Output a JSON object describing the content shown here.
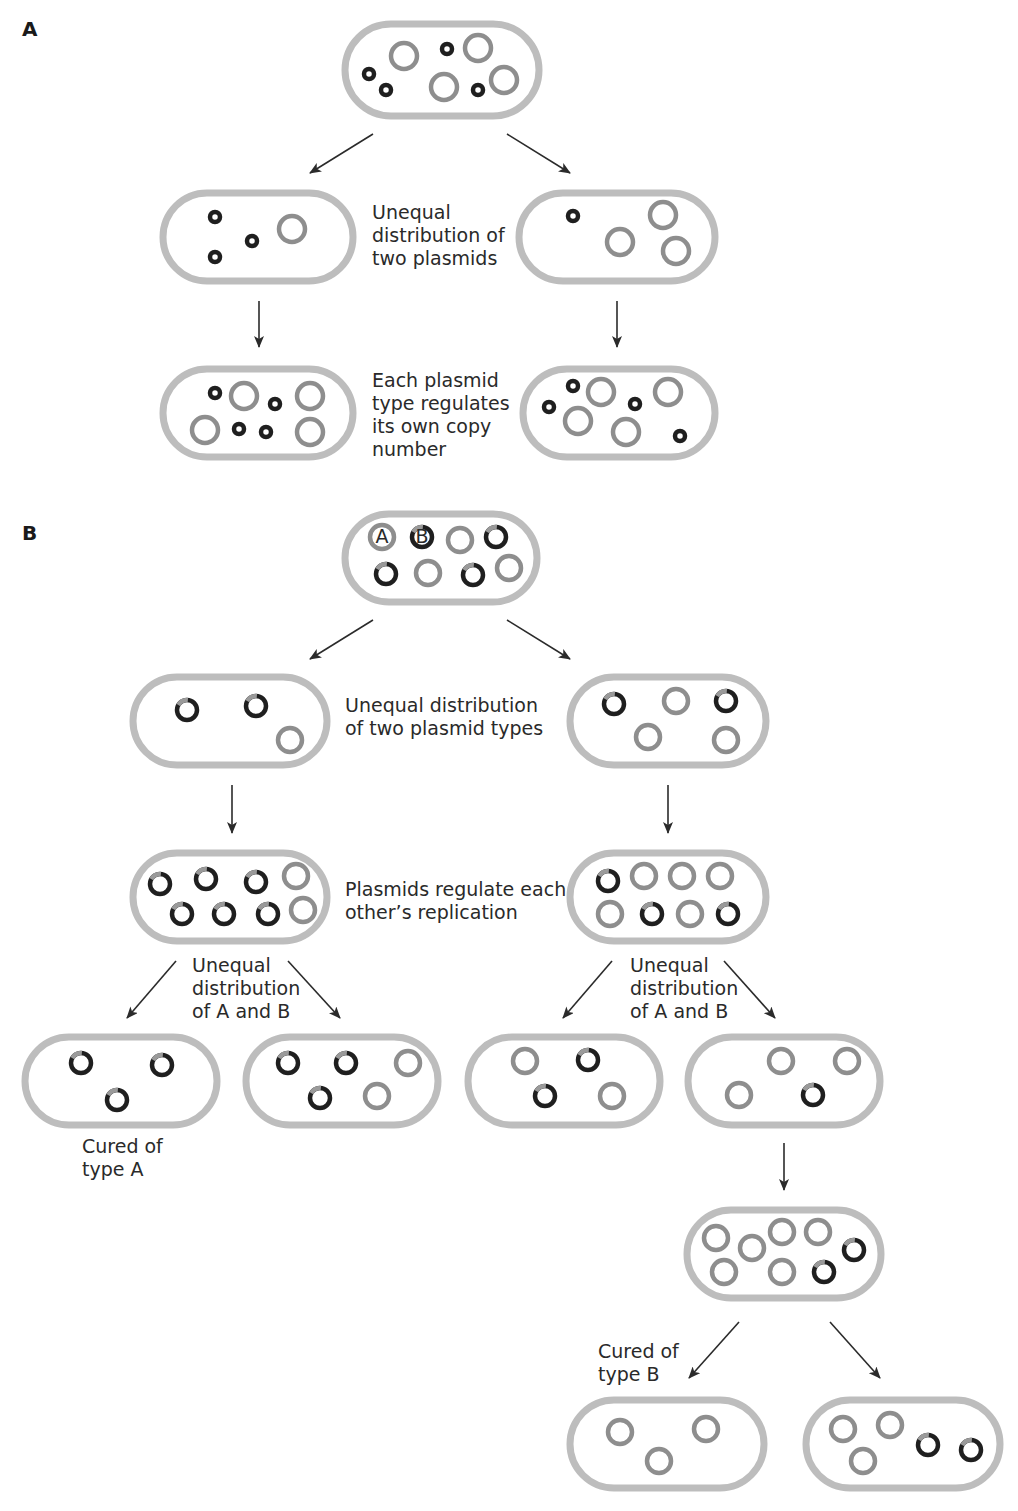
{
  "colors": {
    "cell_wall": "#bdbdbd",
    "plasmid_gray": "#8e8e8e",
    "plasmid_dark": "#1f1f1f",
    "plasmid_dark_tip": "#9a9a9a",
    "text": "#2a2a2a",
    "arrow": "#2b2b2b"
  },
  "panels": [
    {
      "letter": "A",
      "x": 22,
      "y": 22
    },
    {
      "letter": "B",
      "x": 22,
      "y": 526
    }
  ],
  "labels": [
    {
      "id": "a-unequal",
      "x": 372,
      "y": 219,
      "lines": [
        "Unequal",
        "distribution of",
        "two plasmids"
      ]
    },
    {
      "id": "a-regulates",
      "x": 372,
      "y": 387,
      "lines": [
        "Each plasmid",
        "type regulates",
        "its own copy",
        "number"
      ]
    },
    {
      "id": "b-unequal",
      "x": 345,
      "y": 712,
      "lines": [
        "Unequal distribution",
        "of two plasmid types"
      ]
    },
    {
      "id": "b-regulate-each",
      "x": 345,
      "y": 896,
      "lines": [
        "Plasmids regulate each",
        "other’s replication"
      ]
    },
    {
      "id": "b-unequal-ab-left",
      "x": 192,
      "y": 972,
      "lines": [
        "Unequal",
        "distribution",
        "of A and B"
      ]
    },
    {
      "id": "b-unequal-ab-right",
      "x": 630,
      "y": 972,
      "lines": [
        "Unequal",
        "distribution",
        "of A and B"
      ]
    },
    {
      "id": "b-cured-a",
      "x": 82,
      "y": 1153,
      "lines": [
        "Cured of",
        "type A"
      ]
    },
    {
      "id": "b-cured-b",
      "x": 598,
      "y": 1358,
      "lines": [
        "Cured of",
        "type B"
      ]
    }
  ],
  "cells": [
    {
      "id": "a-parent",
      "x": 345,
      "y": 24,
      "w": 194,
      "h": 92,
      "plasmids": [
        {
          "t": "small",
          "x": 369,
          "y": 74
        },
        {
          "t": "small",
          "x": 386,
          "y": 90
        },
        {
          "t": "big",
          "x": 404,
          "y": 56
        },
        {
          "t": "small",
          "x": 447,
          "y": 49
        },
        {
          "t": "big",
          "x": 478,
          "y": 48
        },
        {
          "t": "big",
          "x": 444,
          "y": 87
        },
        {
          "t": "small",
          "x": 478,
          "y": 90
        },
        {
          "t": "big",
          "x": 504,
          "y": 80
        }
      ]
    },
    {
      "id": "a-left-1",
      "x": 163,
      "y": 193,
      "w": 190,
      "h": 88,
      "plasmids": [
        {
          "t": "small",
          "x": 215,
          "y": 217
        },
        {
          "t": "small",
          "x": 215,
          "y": 257
        },
        {
          "t": "small",
          "x": 252,
          "y": 241
        },
        {
          "t": "big",
          "x": 292,
          "y": 229
        }
      ]
    },
    {
      "id": "a-right-1",
      "x": 519,
      "y": 193,
      "w": 196,
      "h": 88,
      "plasmids": [
        {
          "t": "small",
          "x": 573,
          "y": 216
        },
        {
          "t": "big",
          "x": 663,
          "y": 215
        },
        {
          "t": "big",
          "x": 620,
          "y": 242
        },
        {
          "t": "big",
          "x": 676,
          "y": 251
        }
      ]
    },
    {
      "id": "a-left-2",
      "x": 163,
      "y": 369,
      "w": 190,
      "h": 88,
      "plasmids": [
        {
          "t": "small",
          "x": 215,
          "y": 393
        },
        {
          "t": "big",
          "x": 244,
          "y": 396
        },
        {
          "t": "small",
          "x": 275,
          "y": 404
        },
        {
          "t": "big",
          "x": 310,
          "y": 396
        },
        {
          "t": "big",
          "x": 205,
          "y": 430
        },
        {
          "t": "small",
          "x": 239,
          "y": 429
        },
        {
          "t": "small",
          "x": 266,
          "y": 432
        },
        {
          "t": "big",
          "x": 310,
          "y": 432
        }
      ]
    },
    {
      "id": "a-right-2",
      "x": 523,
      "y": 369,
      "w": 192,
      "h": 88,
      "plasmids": [
        {
          "t": "small",
          "x": 573,
          "y": 386
        },
        {
          "t": "small",
          "x": 549,
          "y": 407
        },
        {
          "t": "big",
          "x": 601,
          "y": 392
        },
        {
          "t": "small",
          "x": 635,
          "y": 404
        },
        {
          "t": "big",
          "x": 668,
          "y": 392
        },
        {
          "t": "big",
          "x": 578,
          "y": 421
        },
        {
          "t": "big",
          "x": 626,
          "y": 432
        },
        {
          "t": "small",
          "x": 680,
          "y": 436
        }
      ]
    },
    {
      "id": "b-parent",
      "x": 345,
      "y": 514,
      "w": 192,
      "h": 88,
      "plasmids": [
        {
          "t": "A",
          "x": 382,
          "y": 537,
          "label": "A"
        },
        {
          "t": "B",
          "x": 422,
          "y": 537,
          "label": "B"
        },
        {
          "t": "a",
          "x": 460,
          "y": 540
        },
        {
          "t": "b",
          "x": 496,
          "y": 537
        },
        {
          "t": "b",
          "x": 386,
          "y": 574
        },
        {
          "t": "a",
          "x": 428,
          "y": 573
        },
        {
          "t": "b",
          "x": 473,
          "y": 575
        },
        {
          "t": "a",
          "x": 509,
          "y": 568
        }
      ]
    },
    {
      "id": "b-left-1",
      "x": 133,
      "y": 677,
      "w": 194,
      "h": 88,
      "plasmids": [
        {
          "t": "b",
          "x": 187,
          "y": 710
        },
        {
          "t": "b",
          "x": 256,
          "y": 706
        },
        {
          "t": "a",
          "x": 290,
          "y": 740
        }
      ]
    },
    {
      "id": "b-right-1",
      "x": 570,
      "y": 677,
      "w": 196,
      "h": 88,
      "plasmids": [
        {
          "t": "b",
          "x": 614,
          "y": 704
        },
        {
          "t": "a",
          "x": 676,
          "y": 701
        },
        {
          "t": "b",
          "x": 726,
          "y": 701
        },
        {
          "t": "a",
          "x": 648,
          "y": 737
        },
        {
          "t": "a",
          "x": 726,
          "y": 740
        }
      ]
    },
    {
      "id": "b-left-2",
      "x": 133,
      "y": 853,
      "w": 194,
      "h": 88,
      "plasmids": [
        {
          "t": "b",
          "x": 160,
          "y": 884
        },
        {
          "t": "b",
          "x": 206,
          "y": 879
        },
        {
          "t": "b",
          "x": 256,
          "y": 882
        },
        {
          "t": "a",
          "x": 296,
          "y": 876
        },
        {
          "t": "b",
          "x": 182,
          "y": 914
        },
        {
          "t": "b",
          "x": 224,
          "y": 914
        },
        {
          "t": "b",
          "x": 268,
          "y": 914
        },
        {
          "t": "a",
          "x": 303,
          "y": 910
        }
      ]
    },
    {
      "id": "b-right-2",
      "x": 570,
      "y": 853,
      "w": 196,
      "h": 88,
      "plasmids": [
        {
          "t": "b",
          "x": 608,
          "y": 881
        },
        {
          "t": "a",
          "x": 644,
          "y": 876
        },
        {
          "t": "a",
          "x": 682,
          "y": 876
        },
        {
          "t": "a",
          "x": 720,
          "y": 876
        },
        {
          "t": "a",
          "x": 610,
          "y": 914
        },
        {
          "t": "b",
          "x": 652,
          "y": 914
        },
        {
          "t": "a",
          "x": 690,
          "y": 914
        },
        {
          "t": "b",
          "x": 728,
          "y": 914
        }
      ]
    },
    {
      "id": "b-left-3a",
      "x": 25,
      "y": 1037,
      "w": 192,
      "h": 88,
      "plasmids": [
        {
          "t": "b",
          "x": 81,
          "y": 1063
        },
        {
          "t": "b",
          "x": 162,
          "y": 1065
        },
        {
          "t": "b",
          "x": 117,
          "y": 1100
        }
      ]
    },
    {
      "id": "b-left-3b",
      "x": 246,
      "y": 1037,
      "w": 192,
      "h": 88,
      "plasmids": [
        {
          "t": "b",
          "x": 288,
          "y": 1063
        },
        {
          "t": "b",
          "x": 346,
          "y": 1063
        },
        {
          "t": "a",
          "x": 408,
          "y": 1063
        },
        {
          "t": "b",
          "x": 320,
          "y": 1098
        },
        {
          "t": "a",
          "x": 377,
          "y": 1096
        }
      ]
    },
    {
      "id": "b-right-3a",
      "x": 468,
      "y": 1037,
      "w": 192,
      "h": 88,
      "plasmids": [
        {
          "t": "a",
          "x": 525,
          "y": 1061
        },
        {
          "t": "b",
          "x": 588,
          "y": 1060
        },
        {
          "t": "b",
          "x": 545,
          "y": 1096
        },
        {
          "t": "a",
          "x": 612,
          "y": 1096
        }
      ]
    },
    {
      "id": "b-right-3b",
      "x": 688,
      "y": 1037,
      "w": 192,
      "h": 88,
      "plasmids": [
        {
          "t": "a",
          "x": 781,
          "y": 1061
        },
        {
          "t": "a",
          "x": 847,
          "y": 1061
        },
        {
          "t": "a",
          "x": 739,
          "y": 1095
        },
        {
          "t": "b",
          "x": 813,
          "y": 1095
        }
      ]
    },
    {
      "id": "b-right-4",
      "x": 687,
      "y": 1210,
      "w": 194,
      "h": 88,
      "plasmids": [
        {
          "t": "a",
          "x": 716,
          "y": 1238
        },
        {
          "t": "a",
          "x": 752,
          "y": 1248
        },
        {
          "t": "a",
          "x": 782,
          "y": 1232
        },
        {
          "t": "a",
          "x": 818,
          "y": 1232
        },
        {
          "t": "b",
          "x": 854,
          "y": 1250
        },
        {
          "t": "a",
          "x": 724,
          "y": 1272
        },
        {
          "t": "a",
          "x": 782,
          "y": 1272
        },
        {
          "t": "b",
          "x": 824,
          "y": 1272
        }
      ]
    },
    {
      "id": "b-right-5a",
      "x": 570,
      "y": 1400,
      "w": 194,
      "h": 88,
      "plasmids": [
        {
          "t": "a",
          "x": 620,
          "y": 1432
        },
        {
          "t": "a",
          "x": 706,
          "y": 1429
        },
        {
          "t": "a",
          "x": 659,
          "y": 1461
        }
      ]
    },
    {
      "id": "b-right-5b",
      "x": 806,
      "y": 1400,
      "w": 194,
      "h": 88,
      "plasmids": [
        {
          "t": "a",
          "x": 843,
          "y": 1429
        },
        {
          "t": "a",
          "x": 890,
          "y": 1425
        },
        {
          "t": "b",
          "x": 928,
          "y": 1445
        },
        {
          "t": "b",
          "x": 971,
          "y": 1450
        },
        {
          "t": "a",
          "x": 863,
          "y": 1461
        }
      ]
    }
  ],
  "arrows": [
    {
      "x1": 373,
      "y1": 134,
      "x2": 310,
      "y2": 173
    },
    {
      "x1": 507,
      "y1": 134,
      "x2": 570,
      "y2": 173
    },
    {
      "x1": 259,
      "y1": 301,
      "x2": 259,
      "y2": 347
    },
    {
      "x1": 617,
      "y1": 301,
      "x2": 617,
      "y2": 347
    },
    {
      "x1": 373,
      "y1": 620,
      "x2": 310,
      "y2": 659
    },
    {
      "x1": 507,
      "y1": 620,
      "x2": 570,
      "y2": 659
    },
    {
      "x1": 232,
      "y1": 785,
      "x2": 232,
      "y2": 833
    },
    {
      "x1": 668,
      "y1": 785,
      "x2": 668,
      "y2": 833
    },
    {
      "x1": 176,
      "y1": 961,
      "x2": 127,
      "y2": 1018
    },
    {
      "x1": 288,
      "y1": 961,
      "x2": 340,
      "y2": 1018
    },
    {
      "x1": 612,
      "y1": 961,
      "x2": 563,
      "y2": 1018
    },
    {
      "x1": 724,
      "y1": 961,
      "x2": 775,
      "y2": 1018
    },
    {
      "x1": 784,
      "y1": 1143,
      "x2": 784,
      "y2": 1190
    },
    {
      "x1": 739,
      "y1": 1322,
      "x2": 689,
      "y2": 1378
    },
    {
      "x1": 830,
      "y1": 1322,
      "x2": 880,
      "y2": 1378
    }
  ]
}
